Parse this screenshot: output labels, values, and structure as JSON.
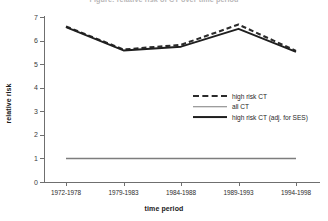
{
  "chart_data": {
    "type": "line",
    "title": "Figure: relative risk of CT over time period",
    "xlabel": "time period",
    "ylabel": "relative risk",
    "categories": [
      "1972-1978",
      "1979-1983",
      "1984-1988",
      "1989-1993",
      "1994-1998"
    ],
    "yticks": [
      0,
      1,
      2,
      3,
      4,
      5,
      6,
      7
    ],
    "ylim": [
      0,
      7
    ],
    "grid": false,
    "legend_position": "center-right",
    "series": [
      {
        "name": "high risk CT",
        "style": "dashed",
        "color": "#2b2b2b",
        "values": [
          6.6,
          5.62,
          5.82,
          6.68,
          5.56
        ]
      },
      {
        "name": "all CT",
        "style": "solid-thin",
        "color": "#7d7d7d",
        "values": [
          1.0,
          1.0,
          1.0,
          1.0,
          1.0
        ]
      },
      {
        "name": "high risk CT (adj. for SES)",
        "style": "solid",
        "color": "#1f1f1f",
        "values": [
          6.57,
          5.58,
          5.74,
          6.5,
          5.52
        ]
      }
    ]
  }
}
